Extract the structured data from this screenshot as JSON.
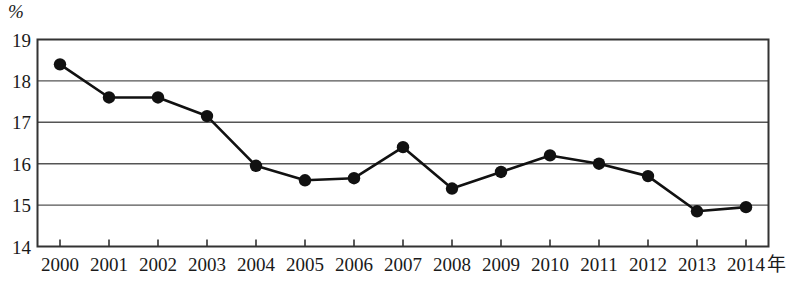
{
  "chart_data": {
    "type": "line",
    "title": "",
    "subtitle": "",
    "xlabel": "年",
    "ylabel": "%",
    "categories": [
      "2000",
      "2001",
      "2002",
      "2003",
      "2004",
      "2005",
      "2006",
      "2007",
      "2008",
      "2009",
      "2010",
      "2011",
      "2012",
      "2013",
      "2014"
    ],
    "values": [
      18.4,
      17.6,
      17.6,
      17.15,
      15.95,
      15.6,
      15.65,
      16.4,
      15.4,
      15.8,
      16.2,
      16.0,
      15.7,
      14.85,
      14.95
    ],
    "series": [
      {
        "name": "",
        "values": [
          18.4,
          17.6,
          17.6,
          17.15,
          15.95,
          15.6,
          15.65,
          16.4,
          15.4,
          15.8,
          16.2,
          16.0,
          15.7,
          14.85,
          14.95
        ]
      }
    ],
    "ylim": [
      14,
      19
    ],
    "yticks": [
      14,
      15,
      16,
      17,
      18,
      19
    ],
    "ytick_labels": [
      "14",
      "15",
      "16",
      "17",
      "18",
      "19"
    ],
    "xlim": [
      "2000",
      "2014"
    ],
    "grid": true,
    "grid_axis": "y",
    "legend": false,
    "legend_position": "none",
    "marker": "filled-circle",
    "line_color": "#111111",
    "marker_color": "#111111",
    "grid_color": "#555555",
    "axis_color": "#333333",
    "background": "#ffffff",
    "annotations": []
  },
  "axes": {
    "y_unit_label": "%",
    "x_axis_name": "年"
  }
}
